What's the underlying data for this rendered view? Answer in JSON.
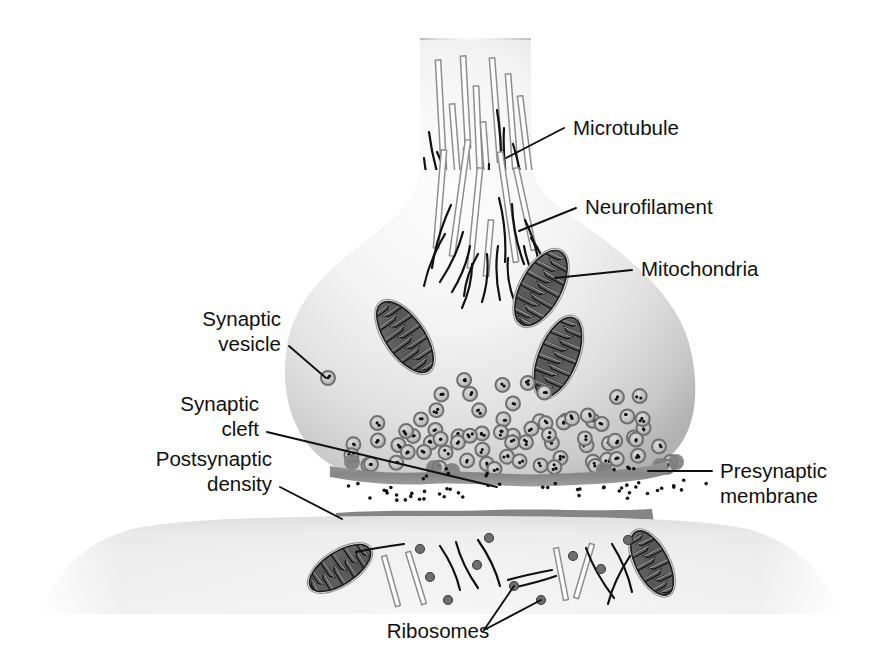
{
  "figure": {
    "type": "biological-diagram",
    "palette": {
      "background": "#ffffff",
      "cytoplasm_light": "#fbfbfb",
      "cytoplasm_mid": "#e3e3e3",
      "cytoplasm_edge": "#b4b4b4",
      "membrane_dark": "#8d8d8d",
      "density_dark": "#8a8a8a",
      "organelle_dark": "#5a5a5a",
      "vesicle_fill": "#c8c8c8",
      "vesicle_ring": "#8f8f8f",
      "ribosome": "#6e6e6e",
      "ink": "#101010"
    }
  },
  "labels": [
    {
      "id": "microtubule",
      "text": "Microtubule",
      "align": "start",
      "x": 573,
      "y": 135,
      "leader": [
        [
          564,
          128
        ],
        [
          506,
          158
        ]
      ]
    },
    {
      "id": "neurofilament",
      "text": "Neurofilament",
      "align": "start",
      "x": 585,
      "y": 214,
      "leader": [
        [
          576,
          208
        ],
        [
          519,
          231
        ]
      ]
    },
    {
      "id": "mitochondria",
      "text": "Mitochondria",
      "align": "start",
      "x": 641,
      "y": 276,
      "leader": [
        [
          632,
          270
        ],
        [
          555,
          278
        ]
      ]
    },
    {
      "id": "synaptic-vesicle",
      "line1": "Synaptic",
      "line2": "vesicle",
      "align": "end",
      "x": 281,
      "y": 326,
      "x2": 281,
      "y2": 351,
      "leader": [
        [
          289,
          346
        ],
        [
          326,
          378
        ]
      ]
    },
    {
      "id": "synaptic-cleft",
      "line1": "Synaptic",
      "line2": "cleft",
      "align": "end",
      "x": 259,
      "y": 411,
      "x2": 259,
      "y2": 436,
      "leader": [
        [
          267,
          432
        ],
        [
          497,
          487
        ]
      ]
    },
    {
      "id": "postsynaptic-density",
      "line1": "Postsynaptic",
      "line2": "density",
      "align": "end",
      "x": 272,
      "y": 466,
      "x2": 272,
      "y2": 491,
      "leader": [
        [
          280,
          487
        ],
        [
          342,
          519
        ]
      ]
    },
    {
      "id": "presynaptic-membrane",
      "line1": "Presynaptic",
      "line2": "membrane",
      "align": "start",
      "x": 720,
      "y": 478,
      "x2": 720,
      "y2": 503,
      "leader": [
        [
          712,
          471
        ],
        [
          648,
          471
        ]
      ]
    },
    {
      "id": "ribosomes",
      "text": "Ribosomes",
      "align": "middle",
      "x": 438,
      "y": 638,
      "leaders": [
        [
          [
            484,
            630
          ],
          [
            514,
            586
          ]
        ],
        [
          [
            484,
            630
          ],
          [
            541,
            600
          ]
        ]
      ]
    }
  ],
  "structures": {
    "axon": {
      "name": "axon-shaft",
      "top": 40,
      "left": 420,
      "right": 531
    },
    "bouton": {
      "name": "presynaptic-terminal",
      "left": 284,
      "right": 692,
      "bottom": 478
    },
    "presynaptic_membrane": {
      "name": "presynaptic-membrane-band",
      "y": 466,
      "thickness": 11
    },
    "synaptic_cleft": {
      "name": "synaptic-cleft-gap",
      "y": 478,
      "height": 30
    },
    "postsynaptic_density": {
      "name": "postsynaptic-density-band",
      "y": 513,
      "thickness": 13
    },
    "postsynaptic_cell": {
      "name": "postsynaptic-cell",
      "top": 516,
      "bottom": 620
    }
  },
  "counts": {
    "microtubules_presynaptic": 9,
    "neurofilaments_presynaptic": 14,
    "mitochondria_presynaptic": 3,
    "mitochondria_postsynaptic": 2,
    "synaptic_vesicles": 72,
    "ribosomes": 10
  },
  "geometry": {
    "mitochondria": [
      {
        "cx": 541,
        "cy": 288,
        "rx": 20,
        "ry": 41,
        "rot": 28
      },
      {
        "cx": 405,
        "cy": 337,
        "rx": 19,
        "ry": 41,
        "rot": -35
      },
      {
        "cx": 558,
        "cy": 357,
        "rx": 19,
        "ry": 42,
        "rot": 22
      },
      {
        "cx": 340,
        "cy": 568,
        "rx": 16,
        "ry": 35,
        "rot": 57
      },
      {
        "cx": 652,
        "cy": 563,
        "rx": 16,
        "ry": 35,
        "rot": -27
      }
    ],
    "microtubules_axon": [
      [
        438,
        60,
        444,
        172
      ],
      [
        463,
        56,
        468,
        148
      ],
      [
        476,
        86,
        480,
        175
      ],
      [
        492,
        58,
        500,
        162
      ],
      [
        508,
        74,
        516,
        177
      ],
      [
        452,
        104,
        460,
        205
      ],
      [
        483,
        122,
        491,
        228
      ],
      [
        520,
        96,
        532,
        193
      ],
      [
        466,
        148,
        474,
        250
      ]
    ],
    "neurofilaments_axon": [
      [
        429,
        132,
        451,
        212
      ],
      [
        437,
        152,
        463,
        236
      ],
      [
        424,
        158,
        445,
        238
      ],
      [
        445,
        176,
        470,
        250
      ],
      [
        455,
        196,
        478,
        258
      ],
      [
        497,
        110,
        499,
        200
      ],
      [
        504,
        128,
        512,
        206
      ],
      [
        513,
        144,
        525,
        222
      ],
      [
        489,
        164,
        498,
        248
      ],
      [
        478,
        186,
        487,
        256
      ],
      [
        508,
        182,
        524,
        248
      ],
      [
        462,
        214,
        472,
        266
      ],
      [
        497,
        214,
        508,
        262
      ],
      [
        519,
        200,
        531,
        240
      ]
    ],
    "vesicle_radius": 7,
    "ribosome_radius": 4.5,
    "cleft_dot_radius": 1.8
  }
}
